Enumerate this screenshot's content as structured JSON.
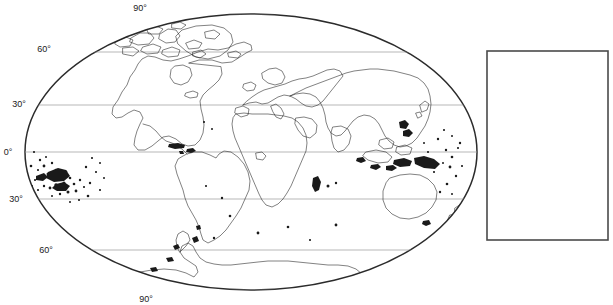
{
  "figure": {
    "kind": "world-map-outline",
    "projection": "oval equal-area (Mollweide-like) world projection",
    "background_color": "#ffffff",
    "outline_color": "#1a1a1a",
    "graticule_color": "#9a9a9a"
  },
  "map": {
    "center_x": 251,
    "center_y": 152,
    "radius_x": 226,
    "radius_y": 138,
    "border_width": 1.5
  },
  "graticule": {
    "label_suffix": "°",
    "latitude_lines": [
      {
        "label": "90°",
        "value": 90,
        "y": 14,
        "hemisphere": "N",
        "label_x": 140,
        "label_y": 11,
        "is_pole": true
      },
      {
        "label": "60°",
        "value": 60,
        "y": 52,
        "hemisphere": "N",
        "label_x": 44,
        "label_y": 50,
        "is_pole": false
      },
      {
        "label": "30°",
        "value": 30,
        "y": 105,
        "hemisphere": "N",
        "label_x": 12,
        "label_y": 104,
        "is_pole": false
      },
      {
        "label": "0°",
        "value": 0,
        "y": 152,
        "hemisphere": "",
        "label_x": 3,
        "label_y": 151,
        "is_pole": false
      },
      {
        "label": "30°",
        "value": -30,
        "y": 199,
        "hemisphere": "S",
        "label_x": 6,
        "label_y": 198,
        "is_pole": false
      },
      {
        "label": "60°",
        "value": -60,
        "y": 250,
        "hemisphere": "S",
        "label_x": 38,
        "label_y": 249,
        "is_pole": false
      },
      {
        "label": "90°",
        "value": -90,
        "y": 290,
        "hemisphere": "S",
        "label_x": 138,
        "label_y": 301,
        "is_pole": true
      }
    ]
  },
  "landmasses": [
    {
      "name": "greenland-and-canadian-arctic"
    },
    {
      "name": "north-america"
    },
    {
      "name": "central-america"
    },
    {
      "name": "south-america"
    },
    {
      "name": "europe"
    },
    {
      "name": "africa"
    },
    {
      "name": "asia"
    },
    {
      "name": "southeast-asia-archipelago"
    },
    {
      "name": "australia"
    },
    {
      "name": "new-zealand"
    },
    {
      "name": "antarctica"
    },
    {
      "name": "pacific-islands"
    },
    {
      "name": "madagascar"
    },
    {
      "name": "japan"
    },
    {
      "name": "british-isles"
    },
    {
      "name": "iceland"
    }
  ],
  "side_panel": {
    "label": "",
    "x": 487,
    "y": 51,
    "width": 121,
    "height": 189,
    "border_color": "#4a4a4a",
    "fill_color": "#ffffff",
    "content": ""
  }
}
